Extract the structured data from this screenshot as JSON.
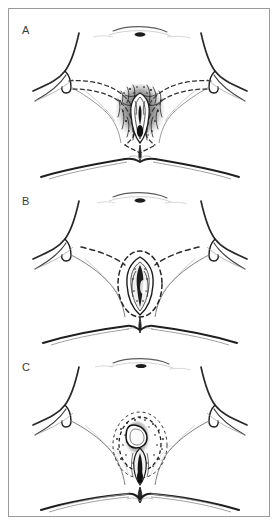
{
  "figure": {
    "type": "medical-anatomical-line-illustration",
    "style": "black-and-white pen-and-ink stipple drawing",
    "border_color": "#9a9a9a",
    "background_color": "#ffffff",
    "ink_color": "#1a1a1a",
    "panel_count": 3,
    "panels": [
      {
        "label": "A",
        "name": "panel-a",
        "description": "Radical vulvectomy margins: wide dashed incision lines extending laterally across both groins, encircling the entire hair-bearing vulva",
        "excision_outline": "wide butterfly / bilateral inguinal dashed lines",
        "lesion_extent": "extensive central stippled lesion filling the vulvar vestibule"
      },
      {
        "label": "B",
        "name": "panel-b",
        "description": "Modified radical vulvectomy margins: dashed oval confined around the introitus with short dashed groin extensions",
        "excision_outline": "central dashed ellipse plus short bilateral groin dashes",
        "lesion_extent": "localized central lesion within the introitus"
      },
      {
        "label": "C",
        "name": "panel-c",
        "description": "Wide local excision margins: small concentric dashed oval closely surrounding the lesion only",
        "excision_outline": "small concentric dashed oval around lesion",
        "lesion_extent": "small focal lesion at the introitus"
      }
    ],
    "landmarks": [
      "umbilicus",
      "inguinal fold",
      "mons pubis",
      "labia majora",
      "labia minora",
      "vaginal introitus",
      "perineal body",
      "anus",
      "buttock crease"
    ]
  }
}
